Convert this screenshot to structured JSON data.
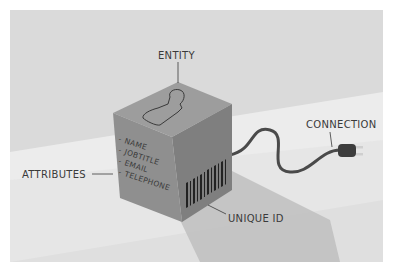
{
  "diagram": {
    "labels": {
      "entity": "ENTITY",
      "attributes": "ATTRIBUTES",
      "connection": "CONNECTION",
      "unique_id": "UNIQUE ID"
    },
    "attribute_list": [
      "NAME",
      "JOBTITLE",
      "EMAIL",
      "TELEPHONE"
    ],
    "icons": {
      "top_face": "person-icon",
      "right_face": "barcode-icon",
      "cable": "power-plug-icon"
    },
    "colors": {
      "background": "#dcdcdc",
      "light_band": "#ececec",
      "cube_front": "#8f8f8f",
      "cube_top": "#9d9d9d",
      "cube_right": "#7f7f7f",
      "shadow": "#bdbdbd",
      "ink": "#3a3a3a"
    }
  }
}
